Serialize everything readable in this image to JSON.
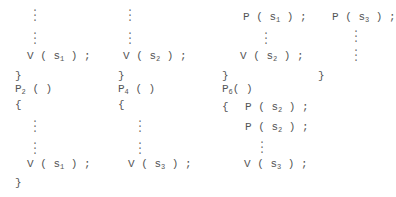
{
  "columns": [
    {
      "id": "col1",
      "lines": [
        {
          "text": "V ( s",
          "sub": "1",
          "tail": " ) ;"
        }
      ],
      "close": "}",
      "next_proc": {
        "name": "P",
        "sub": "2",
        "tail": " ( )"
      },
      "open": "{",
      "body_call": {
        "text": "V ( s",
        "sub": "1",
        "tail": " ) ;"
      },
      "end": "}"
    },
    {
      "id": "col2",
      "lines": [
        {
          "text": "V ( s",
          "sub": "2",
          "tail": " ) ;"
        }
      ],
      "close": "}",
      "next_proc": {
        "name": "P",
        "sub": "4",
        "tail": " ( )"
      },
      "open": "{",
      "body_call": {
        "text": "V ( s",
        "sub": "3",
        "tail": " ) ;"
      }
    },
    {
      "id": "col3",
      "lines": [
        {
          "text": "P ( s",
          "sub": "1",
          "tail": " ) ;"
        },
        {
          "text": "V ( s",
          "sub": "2",
          "tail": " ) ;"
        }
      ],
      "close": "}",
      "next_proc": {
        "name": "P",
        "sub": "6",
        "tail": "( )"
      },
      "open": "{",
      "body_lines": [
        {
          "text": "P ( s",
          "sub": "2",
          "tail": " ) ;"
        },
        {
          "text": "P ( s",
          "sub": "2",
          "tail": " ) ;"
        },
        {
          "text": "V ( s",
          "sub": "3",
          "tail": " ) ;"
        }
      ]
    },
    {
      "id": "col4",
      "lines": [
        {
          "text": "P ( s",
          "sub": "3",
          "tail": " ) ;"
        }
      ],
      "close": "}"
    }
  ]
}
